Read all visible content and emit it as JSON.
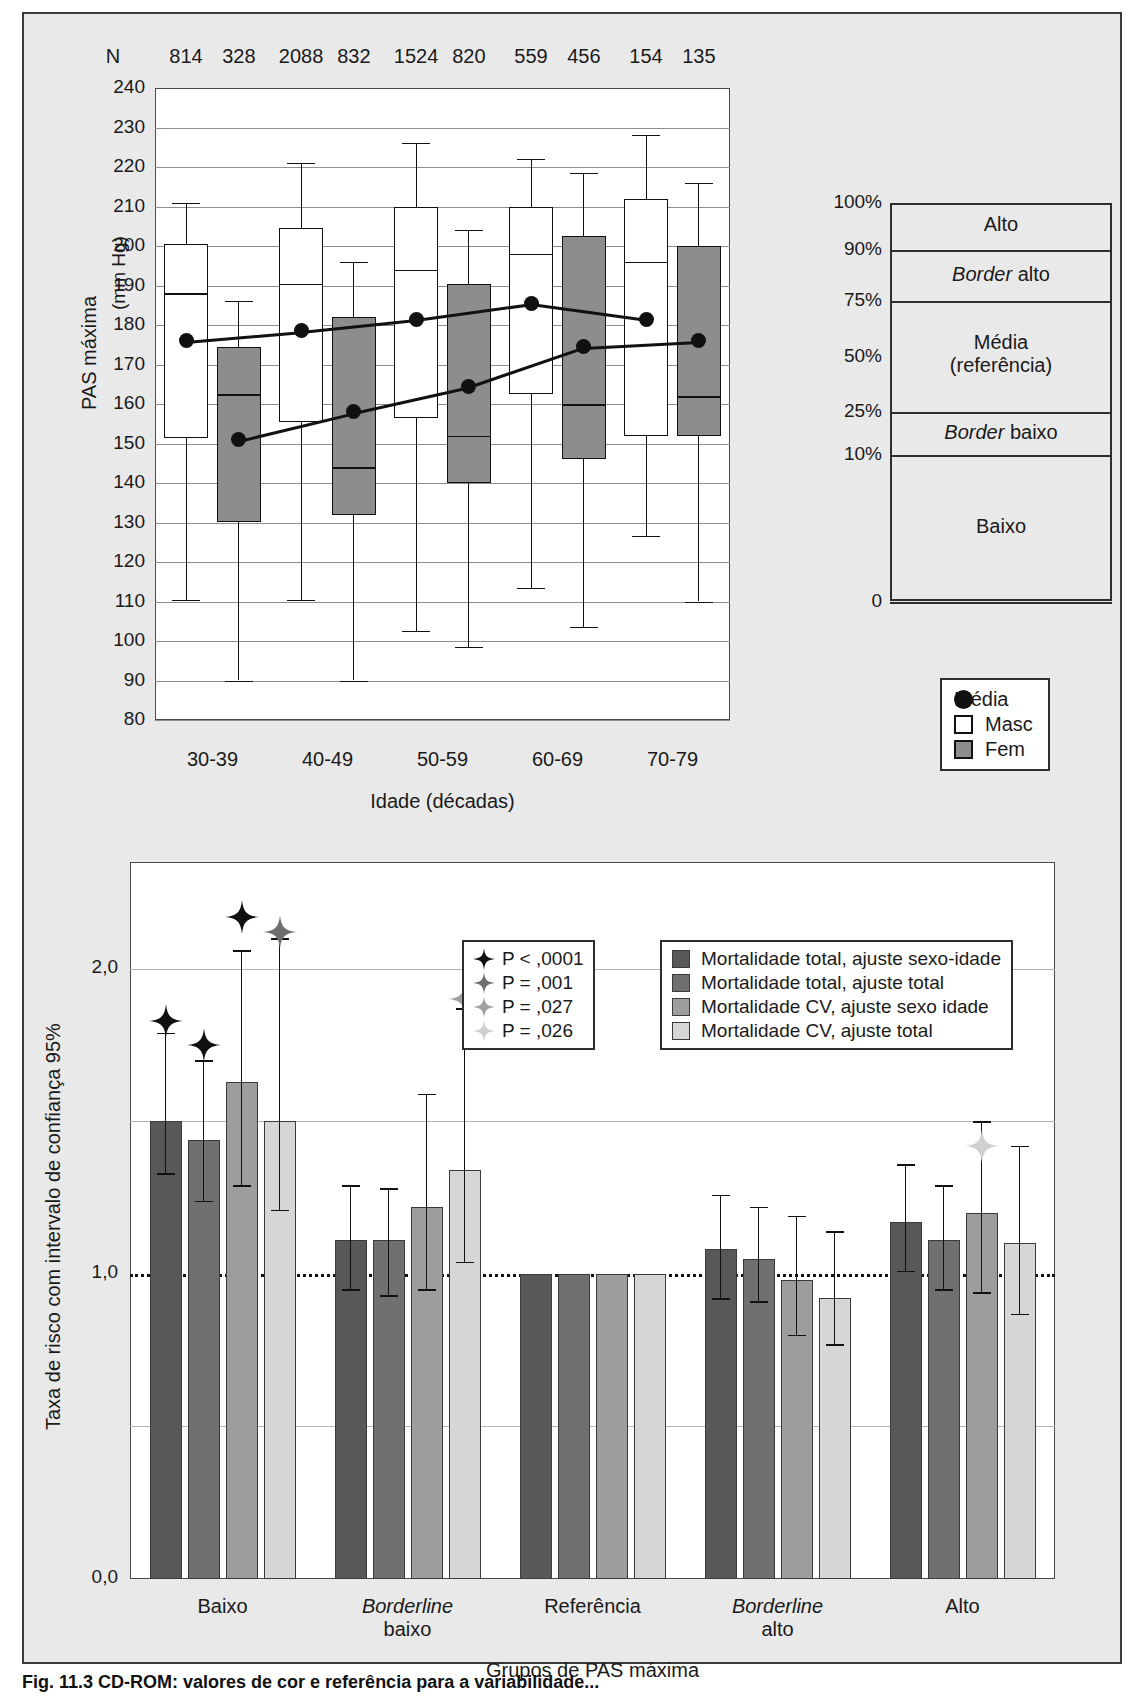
{
  "figure": {
    "caption": "Fig. 11.3 CD-ROM: valores de cor e referência para a variabilidade..."
  },
  "chart_data": [
    {
      "type": "box",
      "id": "top",
      "title": "",
      "ylabel": "PAS máxima",
      "yunit": "(mm Hg)",
      "xlabel": "Idade (décadas)",
      "ylim": [
        80,
        240
      ],
      "yticks": [
        240,
        230,
        220,
        210,
        200,
        190,
        180,
        170,
        160,
        150,
        140,
        130,
        120,
        110,
        100,
        90,
        80
      ],
      "categories": [
        "30-39",
        "40-49",
        "50-59",
        "60-69",
        "70-79"
      ],
      "n_label": "N",
      "n_values": [
        814,
        328,
        2088,
        832,
        1524,
        820,
        559,
        456,
        154,
        135
      ],
      "legend": [
        {
          "label": "Média",
          "marker": "dot"
        },
        {
          "label": "Masc",
          "marker": "square-white"
        },
        {
          "label": "Fem",
          "marker": "square-gray"
        }
      ],
      "series": [
        {
          "name": "Masc",
          "boxes": [
            {
              "cat": "30-39",
              "lower_whisker": 110.5,
              "q1": 151.5,
              "median": 188,
              "q3": 200.5,
              "upper_whisker": 211,
              "mean": 176
            },
            {
              "cat": "40-49",
              "lower_whisker": 110.5,
              "q1": 155.5,
              "median": 190.5,
              "q3": 204.5,
              "upper_whisker": 221,
              "mean": 178.5
            },
            {
              "cat": "50-59",
              "lower_whisker": 102.5,
              "q1": 156.5,
              "median": 194,
              "q3": 210,
              "upper_whisker": 226,
              "mean": 181.5
            },
            {
              "cat": "60-69",
              "lower_whisker": 113.5,
              "q1": 162.5,
              "median": 198,
              "q3": 210,
              "upper_whisker": 222,
              "mean": 185.5
            },
            {
              "cat": "70-79",
              "lower_whisker": 126.5,
              "q1": 152,
              "median": 196,
              "q3": 212,
              "upper_whisker": 228,
              "mean": 181.5
            }
          ]
        },
        {
          "name": "Fem",
          "boxes": [
            {
              "cat": "30-39",
              "lower_whisker": 90,
              "q1": 130,
              "median": 162.5,
              "q3": 174.5,
              "upper_whisker": 186,
              "mean": 151
            },
            {
              "cat": "40-49",
              "lower_whisker": 90,
              "q1": 132,
              "median": 144,
              "q3": 182,
              "upper_whisker": 196,
              "mean": 158
            },
            {
              "cat": "50-59",
              "lower_whisker": 98.5,
              "q1": 140,
              "median": 152,
              "q3": 190.5,
              "upper_whisker": 204,
              "mean": 164.5
            },
            {
              "cat": "60-69",
              "lower_whisker": 103.5,
              "q1": 146,
              "median": 160,
              "q3": 202.5,
              "upper_whisker": 218.5,
              "mean": 174.5
            },
            {
              "cat": "70-79",
              "lower_whisker": 110,
              "q1": 152,
              "median": 162,
              "q3": 200,
              "upper_whisker": 216,
              "mean": 176
            }
          ]
        }
      ],
      "right_scale": {
        "percents": [
          "100%",
          "90%",
          "75%",
          "50%",
          "25%",
          "10%",
          "0"
        ],
        "bands": [
          "Alto",
          "Border alto",
          "Média\n(referência)",
          "Border baixo",
          "Baixo"
        ]
      }
    },
    {
      "type": "bar",
      "id": "bottom",
      "ylabel": "Taxa de risco com intervalo de confiança 95%",
      "xlabel": "Grupos de PAS máxima",
      "ylim": [
        0.0,
        2.35
      ],
      "yticks": [
        "0,0",
        "0,5",
        "1,0",
        "1,5",
        "2,0"
      ],
      "ytick_values": [
        0.0,
        0.5,
        1.0,
        1.5,
        2.0
      ],
      "ytick_shown": [
        "0,0",
        "1,0",
        "2,0"
      ],
      "reference_line": 1.0,
      "categories": [
        "Baixo",
        "Borderline baixo",
        "Referência",
        "Borderline alto",
        "Alto"
      ],
      "series": [
        {
          "name": "Mortalidade total, ajuste sexo-idade",
          "color": "#585858",
          "values": [
            1.5,
            1.11,
            1.0,
            1.08,
            1.17
          ],
          "ci_low": [
            1.33,
            0.95,
            1.0,
            0.92,
            1.01
          ],
          "ci_high": [
            1.79,
            1.29,
            1.0,
            1.26,
            1.36
          ]
        },
        {
          "name": "Mortalidade total, ajuste total",
          "color": "#707070",
          "values": [
            1.44,
            1.11,
            1.0,
            1.05,
            1.11
          ],
          "ci_low": [
            1.24,
            0.93,
            1.0,
            0.91,
            0.95
          ],
          "ci_high": [
            1.7,
            1.28,
            1.0,
            1.22,
            1.29
          ]
        },
        {
          "name": "Mortalidade CV, ajuste sexo idade",
          "color": "#9d9d9d",
          "values": [
            1.63,
            1.22,
            1.0,
            0.98,
            1.2
          ],
          "ci_low": [
            1.29,
            0.95,
            1.0,
            0.8,
            0.94
          ],
          "ci_high": [
            2.06,
            1.59,
            1.0,
            1.19,
            1.5
          ]
        },
        {
          "name": "Mortalidade CV, ajuste total",
          "color": "#d6d6d6",
          "values": [
            1.5,
            1.34,
            1.0,
            0.92,
            1.1
          ],
          "ci_low": [
            1.21,
            1.04,
            1.0,
            0.77,
            0.87
          ],
          "ci_high": [
            2.1,
            1.87,
            1.0,
            1.14,
            1.42
          ]
        }
      ],
      "significance_legend": [
        {
          "label": "P < ,0001",
          "color": "#111111"
        },
        {
          "label": "P = ,001",
          "color": "#6e6e6e"
        },
        {
          "label": "P = ,027",
          "color": "#a0a0a0"
        },
        {
          "label": "P = ,026",
          "color": "#d0d0d0"
        }
      ],
      "markers": [
        {
          "cat": "Baixo",
          "series": 0,
          "color": "#111111",
          "value": 1.83
        },
        {
          "cat": "Baixo",
          "series": 1,
          "color": "#111111",
          "value": 1.75
        },
        {
          "cat": "Baixo",
          "series": 2,
          "color": "#111111",
          "value": 2.17
        },
        {
          "cat": "Baixo",
          "series": 3,
          "color": "#6e6e6e",
          "value": 2.12
        },
        {
          "cat": "Borderline baixo",
          "series": 3,
          "color": "#a0a0a0",
          "value": 1.9
        },
        {
          "cat": "Alto",
          "series": 2,
          "color": "#d0d0d0",
          "value": 1.42
        }
      ]
    }
  ]
}
